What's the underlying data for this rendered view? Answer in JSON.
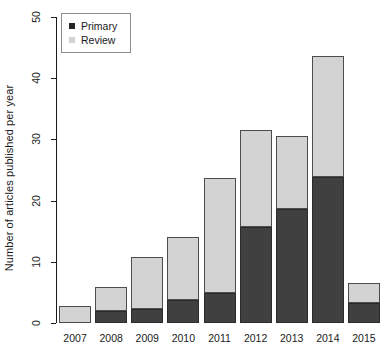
{
  "chart_data": {
    "type": "bar",
    "subtype": "stacked-bar",
    "title": "",
    "subtitle": "",
    "xlabel": "",
    "ylabel": "Number of articles published per year",
    "categories": [
      "2007",
      "2008",
      "2009",
      "2010",
      "2011",
      "2012",
      "2013",
      "2014",
      "2015"
    ],
    "series": [
      {
        "name": "Primary",
        "color": "#404040",
        "values": [
          0,
          2,
          2.3,
          3.7,
          4.9,
          15.7,
          18.7,
          23.9,
          3.3
        ]
      },
      {
        "name": "Review",
        "color": "#d3d3d3",
        "values": [
          2.8,
          3.9,
          8.5,
          10.3,
          18.8,
          15.8,
          11.9,
          19.8,
          3.3
        ]
      }
    ],
    "totals": [
      2.8,
      5.9,
      10.8,
      14.0,
      23.7,
      31.5,
      30.6,
      43.7,
      6.6
    ],
    "ylim": [
      0,
      50
    ],
    "yticks": [
      0,
      10,
      20,
      30,
      40,
      50
    ],
    "ytick_labels": [
      "0",
      "10",
      "20",
      "30",
      "40",
      "50"
    ],
    "grid": false,
    "legend_position": "top-left",
    "legend_entries": [
      "Primary",
      "Review"
    ]
  },
  "legend": {
    "primary_label": "Primary",
    "review_label": "Review",
    "primary_swatch_name": "primary-swatch",
    "review_swatch_name": "review-swatch"
  },
  "axes": {
    "y_title": "Number of articles published per year"
  }
}
